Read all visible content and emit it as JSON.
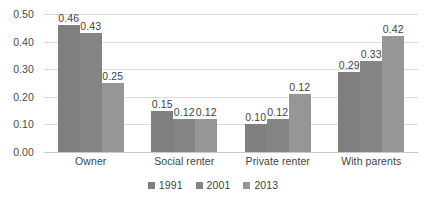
{
  "chart_data": {
    "type": "bar",
    "title": "",
    "subtitle": "",
    "xlabel": "",
    "ylabel": "",
    "ylim": [
      0,
      0.5
    ],
    "yticks": [
      "0.00",
      "0.10",
      "0.20",
      "0.30",
      "0.40",
      "0.50"
    ],
    "ytick_values": [
      0,
      0.1,
      0.2,
      0.3,
      0.4,
      0.5
    ],
    "grid": "horizontal",
    "legend_position": "bottom",
    "categories": [
      "Owner",
      "Social renter",
      "Private renter",
      "With parents"
    ],
    "series": [
      {
        "name": "1991",
        "color": "#7f7f7f",
        "values": [
          0.46,
          0.15,
          0.1,
          0.29
        ],
        "labels": [
          "0.46",
          "0.15",
          "0.10",
          "0.29"
        ]
      },
      {
        "name": "2001",
        "color": "#848484",
        "values": [
          0.43,
          0.12,
          0.12,
          0.33
        ],
        "labels": [
          "0.43",
          "0.12",
          "0.12",
          "0.33"
        ]
      },
      {
        "name": "2013",
        "color": "#969696",
        "values": [
          0.25,
          0.12,
          0.21,
          0.42
        ],
        "labels": [
          "0.25",
          "0.12",
          "0.12",
          "0.42"
        ]
      }
    ]
  },
  "colors": {
    "background": "#ffffff",
    "gridline": "#d9d9d9",
    "axis_text": "#3f3f3f",
    "series_1991": "#7f7f7f",
    "series_2001": "#848484",
    "series_2013": "#969696"
  }
}
